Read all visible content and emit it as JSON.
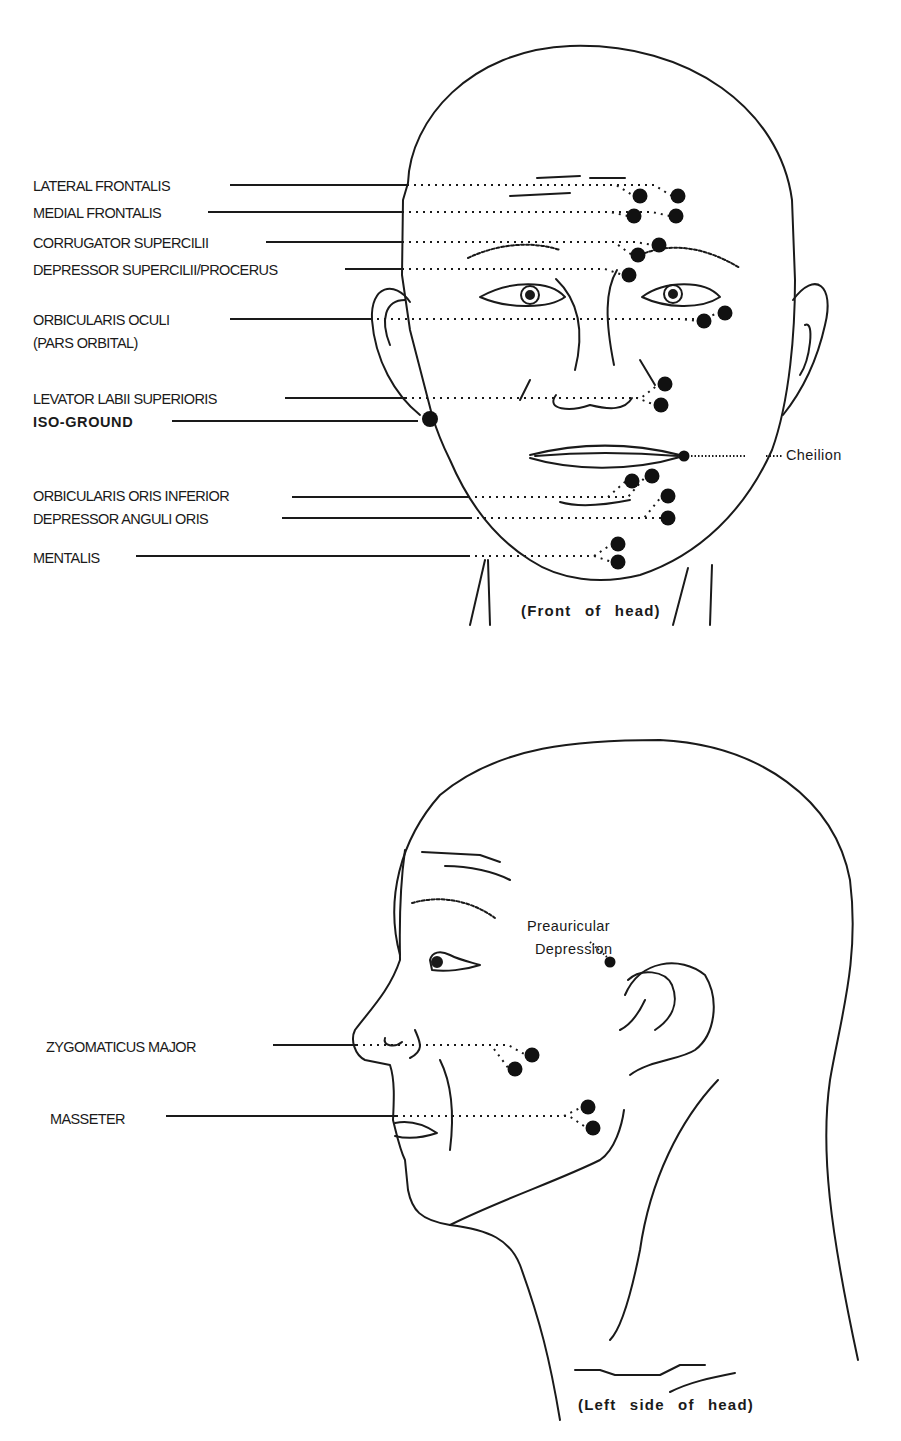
{
  "front_view": {
    "caption": "(Front of head)",
    "labels": [
      {
        "id": "lateral-frontalis",
        "text": "LATERAL FRONTALIS",
        "x": 33,
        "y": 179,
        "line_x1": 230,
        "line_x2": 407,
        "line_y": 185,
        "electrodes": [
          [
            640,
            196
          ],
          [
            678,
            196
          ]
        ]
      },
      {
        "id": "medial-frontalis",
        "text": "MEDIAL FRONTALIS",
        "x": 33,
        "y": 206,
        "line_x1": 208,
        "line_x2": 402,
        "line_y": 212,
        "electrodes": [
          [
            634,
            216
          ],
          [
            676,
            216
          ]
        ]
      },
      {
        "id": "corrugator-supercilii",
        "text": "CORRUGATOR SUPERCILII",
        "x": 33,
        "y": 236,
        "line_x1": 266,
        "line_x2": 402,
        "line_y": 242,
        "electrodes": [
          [
            638,
            255
          ],
          [
            659,
            245
          ]
        ]
      },
      {
        "id": "depressor-supercilii-procerus",
        "text": "DEPRESSOR SUPERCILII/PROCERUS",
        "x": 33,
        "y": 263,
        "line_x1": 345,
        "line_x2": 402,
        "line_y": 269,
        "electrodes": [
          [
            629,
            275
          ]
        ]
      },
      {
        "id": "orbicularis-oculi",
        "text": "ORBICULARIS OCULI",
        "x": 33,
        "y": 313,
        "line_x1": 230,
        "line_x2": 370,
        "line_y": 319,
        "electrodes": [
          [
            704,
            321
          ],
          [
            725,
            313
          ]
        ]
      },
      {
        "id": "levator-labii-superioris",
        "text": "LEVATOR LABII SUPERIORIS",
        "x": 33,
        "y": 392,
        "line_x1": 285,
        "line_x2": 405,
        "line_y": 398,
        "electrodes": [
          [
            665,
            384
          ],
          [
            661,
            405
          ]
        ]
      },
      {
        "id": "orbicularis-oris-inferior",
        "text": "ORBICULARIS ORIS INFERIOR",
        "x": 33,
        "y": 489,
        "line_x1": 292,
        "line_x2": 468,
        "line_y": 497,
        "electrodes": [
          [
            632,
            481
          ],
          [
            652,
            476
          ]
        ]
      },
      {
        "id": "depressor-anguli-oris",
        "text": "DEPRESSOR ANGULI ORIS",
        "x": 33,
        "y": 512,
        "line_x1": 282,
        "line_x2": 470,
        "line_y": 518,
        "electrodes": [
          [
            668,
            496
          ],
          [
            668,
            518
          ]
        ]
      },
      {
        "id": "mentalis",
        "text": "MENTALIS",
        "x": 33,
        "y": 551,
        "line_x1": 136,
        "line_x2": 468,
        "line_y": 556,
        "electrodes": [
          [
            618,
            544
          ],
          [
            618,
            562
          ]
        ]
      }
    ],
    "sublabel": {
      "id": "pars-orbital",
      "text": "(PARS ORBITAL)",
      "x": 33,
      "y": 336
    },
    "ground": {
      "id": "iso-ground",
      "text": "ISO-GROUND",
      "x": 33,
      "y": 415,
      "line_x1": 172,
      "line_x2": 418,
      "line_y": 421,
      "electrode": [
        430,
        419
      ]
    },
    "landmark": {
      "id": "cheilion",
      "text": "Cheilion",
      "x": 786,
      "y": 447,
      "point": [
        684,
        456
      ]
    }
  },
  "side_view": {
    "caption": "(Left side of head)",
    "labels": [
      {
        "id": "zygomaticus-major",
        "text": "ZYGOMATICUS MAJOR",
        "x": 46,
        "y": 1040,
        "line_x1": 273,
        "line_x2": 356,
        "line_y": 1045,
        "electrodes": [
          [
            532,
            1055
          ],
          [
            515,
            1069
          ]
        ]
      },
      {
        "id": "masseter",
        "text": "MASSETER",
        "x": 50,
        "y": 1112,
        "line_x1": 166,
        "line_x2": 396,
        "line_y": 1116,
        "electrodes": [
          [
            588,
            1107
          ],
          [
            593,
            1128
          ]
        ]
      }
    ],
    "landmark": {
      "id": "preauricular-depression",
      "text_line1": "Preauricular",
      "text_line2": "Depression",
      "x": 527,
      "y": 918,
      "point": [
        610,
        962
      ]
    }
  },
  "colors": {
    "ink": "#1a1a1a",
    "background": "#ffffff"
  }
}
